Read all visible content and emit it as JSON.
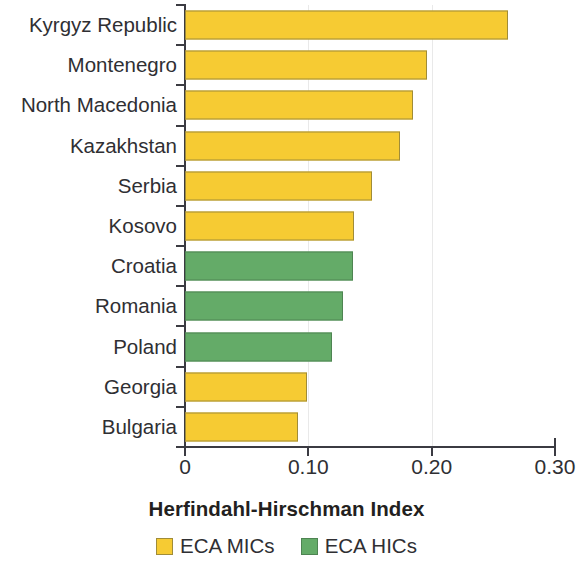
{
  "chart_data": {
    "type": "bar",
    "orientation": "horizontal",
    "title": "",
    "xlabel": "Herfindahl-Hirschman Index",
    "ylabel": "",
    "xlim": [
      0,
      0.3
    ],
    "xticks": [
      "0",
      "0.10",
      "0.20",
      "0.30"
    ],
    "xtick_values": [
      0,
      0.1,
      0.2,
      0.3
    ],
    "grid": "faint vertical gridlines at 0.10 and 0.20",
    "legend_position": "bottom-center",
    "categories": [
      "Kyrgyz Republic",
      "Montenegro",
      "North Macedonia",
      "Kazakhstan",
      "Serbia",
      "Kosovo",
      "Croatia",
      "Romania",
      "Poland",
      "Georgia",
      "Bulgaria"
    ],
    "values": [
      0.262,
      0.196,
      0.185,
      0.174,
      0.152,
      0.137,
      0.136,
      0.128,
      0.119,
      0.099,
      0.092
    ],
    "groups": [
      "ECA MICs",
      "ECA MICs",
      "ECA MICs",
      "ECA MICs",
      "ECA MICs",
      "ECA MICs",
      "ECA HICs",
      "ECA HICs",
      "ECA HICs",
      "ECA MICs",
      "ECA MICs"
    ],
    "series": [
      {
        "name": "ECA MICs",
        "color": "#f6cb33",
        "points": [
          {
            "category": "Kyrgyz Republic",
            "value": 0.262
          },
          {
            "category": "Montenegro",
            "value": 0.196
          },
          {
            "category": "North Macedonia",
            "value": 0.185
          },
          {
            "category": "Kazakhstan",
            "value": 0.174
          },
          {
            "category": "Serbia",
            "value": 0.152
          },
          {
            "category": "Kosovo",
            "value": 0.137
          },
          {
            "category": "Georgia",
            "value": 0.099
          },
          {
            "category": "Bulgaria",
            "value": 0.092
          }
        ]
      },
      {
        "name": "ECA HICs",
        "color": "#64ab68",
        "points": [
          {
            "category": "Croatia",
            "value": 0.136
          },
          {
            "category": "Romania",
            "value": 0.128
          },
          {
            "category": "Poland",
            "value": 0.119
          }
        ]
      }
    ],
    "legend": [
      {
        "label": "ECA MICs",
        "color": "#f6cb33"
      },
      {
        "label": "ECA HICs",
        "color": "#64ab68"
      }
    ]
  },
  "colors": {
    "mic": "#f6cb33",
    "hic": "#64ab68",
    "axis": "#3b3b42",
    "text": "#2f2f33",
    "background": "#ffffff"
  }
}
